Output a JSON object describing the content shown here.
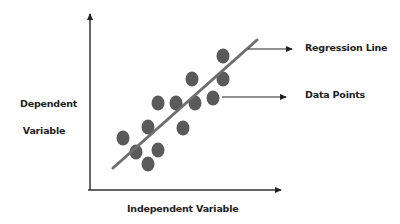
{
  "labels": {
    "regression_line": "Regression Line",
    "data_points": "Data Points",
    "y_axis_line1": "Dependent",
    "y_axis_line2": "Variable",
    "x_axis": "Independent Variable"
  },
  "colors": {
    "axis": "#333333",
    "points": "#5a5a5a",
    "regression_line": "#6e6e6e",
    "text": "#1e1e1e"
  },
  "chart_data": {
    "type": "scatter",
    "title": "",
    "xlabel": "Independent Variable",
    "ylabel": "Dependent Variable",
    "grid": false,
    "ticks": false,
    "annotations": [
      "Regression Line",
      "Data Points"
    ],
    "points_px": [
      [
        123,
        138
      ],
      [
        136,
        152
      ],
      [
        148,
        164
      ],
      [
        148,
        127
      ],
      [
        158,
        150
      ],
      [
        158,
        103
      ],
      [
        176,
        103
      ],
      [
        183,
        128
      ],
      [
        195,
        103
      ],
      [
        192,
        79
      ],
      [
        213,
        98
      ],
      [
        223,
        79
      ],
      [
        223,
        56
      ]
    ],
    "regression_line_px": [
      [
        113,
        168
      ],
      [
        257,
        40
      ]
    ],
    "axes_px": {
      "origin": [
        90,
        190
      ],
      "y_top": [
        90,
        12
      ],
      "x_right": [
        283,
        190
      ]
    },
    "callouts_px": {
      "regression_line": [
        [
          248,
          49
        ],
        [
          292,
          49
        ]
      ],
      "data_points": [
        [
          222,
          97
        ],
        [
          286,
          97
        ]
      ]
    }
  }
}
